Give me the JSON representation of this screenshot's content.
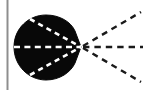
{
  "figure": {
    "width": 143,
    "height": 90,
    "background_color": "#ffffff",
    "caption": ""
  },
  "colors": {
    "background": "#ffffff",
    "blob_fill": "#080808",
    "ray_outside": "#1a1a1a",
    "ray_inside": "#ffffff",
    "axis_rule": "#8e8e8e"
  },
  "axis_rule": {
    "name": "left-vertical-rule",
    "x": 7.5,
    "y1": 0,
    "y2": 90,
    "stroke_width": 2,
    "color": "#8e8e8e"
  },
  "focus_point": {
    "label": "convergence-vertex",
    "x": 81,
    "y": 47
  },
  "blob": {
    "label": "filled-scattering-region",
    "fill": "#080808",
    "center_x": 46,
    "center_y": 47,
    "radius_x": 33,
    "radius_y": 32,
    "apex_x": 81,
    "apex_y": 47
  },
  "chart_data": {
    "type": "scatter",
    "xlabel": "",
    "ylabel": "",
    "xlim": [
      0,
      143
    ],
    "ylim": [
      0,
      90
    ],
    "grid": false,
    "legend": "none",
    "annotations": [],
    "series": [
      {
        "name": "ray-upper-inside",
        "style": "dashed",
        "color": "#ffffff",
        "x": [
          30,
          81
        ],
        "y": [
          19,
          47
        ]
      },
      {
        "name": "ray-middle-inside",
        "style": "dashed",
        "color": "#ffffff",
        "x": [
          14,
          81
        ],
        "y": [
          47,
          47
        ]
      },
      {
        "name": "ray-lower-inside",
        "style": "dashed",
        "color": "#ffffff",
        "x": [
          30,
          81
        ],
        "y": [
          75,
          47
        ]
      },
      {
        "name": "ray-upper-outside",
        "style": "dashed",
        "color": "#1a1a1a",
        "x": [
          83,
          141
        ],
        "y": [
          46,
          12
        ]
      },
      {
        "name": "ray-middle-outside",
        "style": "dashed",
        "color": "#1a1a1a",
        "x": [
          83,
          143
        ],
        "y": [
          47,
          47
        ]
      },
      {
        "name": "ray-lower-outside",
        "style": "dashed",
        "color": "#1a1a1a",
        "x": [
          83,
          141
        ],
        "y": [
          48,
          82
        ]
      }
    ]
  }
}
